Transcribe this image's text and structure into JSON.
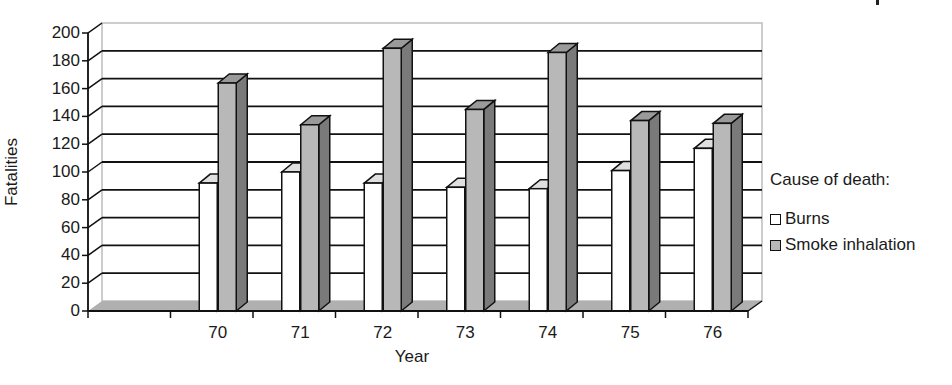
{
  "chart_data": {
    "type": "bar",
    "style": "3d-clustered-column",
    "title": "",
    "xlabel": "Year",
    "ylabel": "Fatalities",
    "categories": [
      "",
      "70",
      "71",
      "72",
      "73",
      "74",
      "75",
      "76"
    ],
    "series": [
      {
        "name": "Burns",
        "color": "#ffffff",
        "values": [
          null,
          92,
          100,
          92,
          89,
          88,
          101,
          117
        ]
      },
      {
        "name": "Smoke inhalation",
        "color": "#b8b8b8",
        "values": [
          null,
          164,
          134,
          189,
          145,
          186,
          137,
          135
        ]
      }
    ],
    "ylim": [
      0,
      200
    ],
    "yticks": [
      0,
      20,
      40,
      60,
      80,
      100,
      120,
      140,
      160,
      180,
      200
    ],
    "grid": true,
    "legend": {
      "title": "Cause of death:",
      "position": "right"
    }
  },
  "labels": {
    "ylabel": "Fatalities",
    "xlabel": "Year",
    "legend_title": "Cause of death:",
    "legend_burns": "Burns",
    "legend_smoke": "Smoke inhalation"
  },
  "colors": {
    "burns_front": "#ffffff",
    "burns_top": "#e0e0e0",
    "smoke_front": "#b8b8b8",
    "smoke_side": "#7a7a7a",
    "smoke_top": "#9a9a9a",
    "floor": "#b0b0b0",
    "grid": "#111111",
    "wall_edge": "#bdbdbd"
  }
}
